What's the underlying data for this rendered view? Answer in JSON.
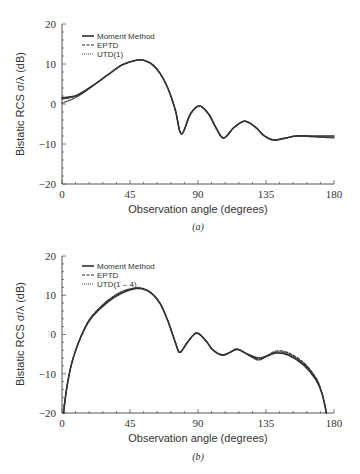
{
  "chart_data": [
    {
      "type": "line",
      "panel_label": "(a)",
      "title": "",
      "xlabel": "Observation angle (degrees)",
      "ylabel": "Bistatic RCS σ/λ (dB)",
      "xlim": [
        0,
        180
      ],
      "ylim": [
        -20,
        20
      ],
      "xticks": [
        0,
        45,
        90,
        135,
        180
      ],
      "yticks": [
        -20,
        -10,
        0,
        10,
        20
      ],
      "grid": false,
      "legend_position": "upper-left",
      "legend": [
        "Moment Method",
        "EPTD",
        "UTD(1)"
      ],
      "series": [
        {
          "name": "Moment Method",
          "style": "solid",
          "x": [
            0,
            10,
            20,
            30,
            40,
            50,
            55,
            60,
            65,
            70,
            75,
            79,
            85,
            91,
            97,
            102,
            107,
            114,
            121,
            128,
            134,
            140,
            147,
            155,
            165,
            180
          ],
          "y": [
            1.5,
            2.2,
            4.5,
            7.2,
            9.8,
            11.0,
            10.8,
            9.8,
            7.6,
            4.0,
            -1.5,
            -7.5,
            -2.5,
            -0.5,
            -2.5,
            -6.0,
            -8.5,
            -5.8,
            -4.3,
            -5.8,
            -8.0,
            -9.0,
            -8.6,
            -8.0,
            -8.0,
            -8.0
          ]
        },
        {
          "name": "EPTD",
          "style": "dashed",
          "x": [
            0,
            10,
            20,
            30,
            40,
            50,
            55,
            60,
            65,
            70,
            75,
            79,
            85,
            91,
            97,
            102,
            107,
            114,
            121,
            128,
            134,
            140,
            147,
            155,
            165,
            180
          ],
          "y": [
            1.2,
            2.1,
            4.5,
            7.2,
            9.8,
            11.0,
            10.8,
            9.8,
            7.6,
            4.0,
            -1.5,
            -7.5,
            -2.5,
            -0.5,
            -2.5,
            -6.0,
            -8.5,
            -5.8,
            -4.3,
            -5.8,
            -8.0,
            -9.0,
            -8.6,
            -8.0,
            -8.1,
            -8.3
          ]
        },
        {
          "name": "UTD(1)",
          "style": "dotted",
          "x": [
            0,
            10,
            20,
            30,
            40,
            50,
            55,
            60,
            65,
            70,
            75,
            79,
            85,
            91,
            97,
            102,
            107,
            114,
            121,
            128,
            134,
            140,
            147,
            155,
            165,
            180
          ],
          "y": [
            0.2,
            1.8,
            4.4,
            7.2,
            9.8,
            11.0,
            10.8,
            9.8,
            7.6,
            4.0,
            -1.5,
            -7.5,
            -2.5,
            -0.5,
            -2.5,
            -6.0,
            -8.5,
            -5.8,
            -4.3,
            -5.8,
            -8.0,
            -9.0,
            -8.6,
            -8.0,
            -8.2,
            -8.5
          ]
        }
      ]
    },
    {
      "type": "line",
      "panel_label": "(b)",
      "title": "",
      "xlabel": "Observation angle (degrees)",
      "ylabel": "Bistatic RCS σ/λ (dB)",
      "xlim": [
        0,
        180
      ],
      "ylim": [
        -20,
        20
      ],
      "xticks": [
        0,
        45,
        90,
        135,
        180
      ],
      "yticks": [
        -20,
        -10,
        0,
        10,
        20
      ],
      "grid": false,
      "legend_position": "upper-left",
      "legend": [
        "Moment Method",
        "EPTD",
        "UTD(1 – 4)"
      ],
      "series": [
        {
          "name": "Moment Method",
          "style": "solid",
          "x": [
            1,
            3,
            6,
            10,
            15,
            20,
            30,
            40,
            49,
            55,
            60,
            65,
            70,
            75,
            78,
            83,
            89,
            95,
            100,
            106,
            111,
            116,
            123,
            130,
            136,
            142,
            150,
            160,
            168,
            172,
            175
          ],
          "y": [
            -20,
            -14,
            -8,
            -3,
            1.5,
            4.5,
            8.2,
            10.6,
            11.7,
            11.4,
            10.2,
            7.8,
            3.5,
            -2.0,
            -4.5,
            -2.0,
            0.3,
            -1.5,
            -4.0,
            -5.2,
            -4.6,
            -3.8,
            -5.0,
            -6.0,
            -5.4,
            -4.7,
            -5.3,
            -7.8,
            -11.5,
            -15.0,
            -20
          ]
        },
        {
          "name": "EPTD",
          "style": "dashed",
          "x": [
            1,
            3,
            6,
            10,
            15,
            20,
            30,
            40,
            49,
            55,
            60,
            65,
            70,
            75,
            78,
            83,
            89,
            95,
            100,
            106,
            111,
            116,
            123,
            130,
            136,
            142,
            150,
            160,
            168,
            172,
            175
          ],
          "y": [
            -20,
            -14,
            -8,
            -3,
            1.5,
            4.6,
            8.4,
            10.8,
            11.8,
            11.5,
            10.3,
            7.9,
            3.6,
            -2.0,
            -4.6,
            -2.0,
            0.4,
            -1.5,
            -4.0,
            -5.3,
            -4.6,
            -3.7,
            -5.1,
            -6.3,
            -5.3,
            -4.2,
            -4.7,
            -7.2,
            -11.0,
            -14.8,
            -20
          ]
        },
        {
          "name": "UTD(1 – 4)",
          "style": "dotted",
          "x": [
            1,
            3,
            6,
            10,
            15,
            20,
            30,
            40,
            49,
            55,
            60,
            65,
            70,
            75,
            78,
            83,
            89,
            95,
            100,
            106,
            111,
            116,
            123,
            130,
            136,
            142,
            150,
            160,
            168,
            172,
            175
          ],
          "y": [
            -20,
            -14,
            -8,
            -3,
            1.6,
            4.8,
            8.6,
            11.0,
            11.9,
            11.5,
            10.3,
            7.9,
            3.6,
            -2.0,
            -4.6,
            -2.0,
            0.4,
            -1.5,
            -4.0,
            -5.3,
            -4.6,
            -3.7,
            -5.2,
            -6.5,
            -5.5,
            -4.5,
            -5.0,
            -7.5,
            -11.2,
            -15.0,
            -20
          ]
        }
      ]
    }
  ],
  "panels": [
    {
      "caption": "(a)",
      "xlabel": "Observation angle (degrees)",
      "ylabel": "Bistatic RCS σ/λ (dB)",
      "xtick_labels": [
        "0",
        "45",
        "90",
        "135",
        "180"
      ],
      "ytick_labels": [
        "20",
        "10",
        "0",
        "−10",
        "−20"
      ],
      "legend": [
        "Moment Method",
        "EPTD",
        "UTD(1)"
      ]
    },
    {
      "caption": "(b)",
      "xlabel": "Observation angle (degrees)",
      "ylabel": "Bistatic RCS σ/λ (dB)",
      "xtick_labels": [
        "0",
        "45",
        "90",
        "135",
        "180"
      ],
      "ytick_labels": [
        "20",
        "10",
        "0",
        "−10",
        "−20"
      ],
      "legend": [
        "Moment Method",
        "EPTD",
        "UTD(1 – 4)"
      ]
    }
  ],
  "colors": {
    "line": "#333333",
    "axis": "#555555",
    "text": "#333333",
    "background": "#ffffff"
  }
}
